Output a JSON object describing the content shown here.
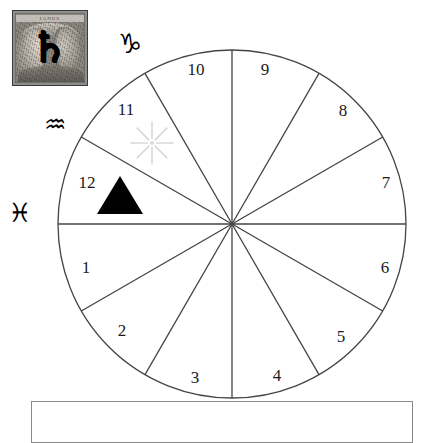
{
  "figure": {
    "background_color": "#ffffff"
  },
  "plate": {
    "caption": "IANUS",
    "overlay_glyph": "♄",
    "overlay_glyph_name": "saturn-symbol",
    "subject": "Janus two-faced bust engraving",
    "border_color": "#3a3a3a"
  },
  "zodiac_glyphs": [
    {
      "name": "capricorn",
      "glyph": "♑",
      "label": "Capricorn"
    },
    {
      "name": "aquarius",
      "glyph": "♒",
      "label": "Aquarius"
    },
    {
      "name": "pisces",
      "glyph": "♓",
      "label": "Pisces"
    }
  ],
  "wheel": {
    "center_x": 232,
    "center_y": 224,
    "radius": 174,
    "sector_count": 12,
    "stroke_color": "#444444",
    "stroke_width": 1.3,
    "houses": [
      {
        "number": "1",
        "label_x": 86,
        "label_y": 269
      },
      {
        "number": "2",
        "label_x": 122,
        "label_y": 332
      },
      {
        "number": "3",
        "label_x": 195,
        "label_y": 379
      },
      {
        "number": "4",
        "label_x": 277,
        "label_y": 377
      },
      {
        "number": "5",
        "label_x": 341,
        "label_y": 338
      },
      {
        "number": "6",
        "label_x": 385,
        "label_y": 269
      },
      {
        "number": "7",
        "label_x": 386,
        "label_y": 184
      },
      {
        "number": "8",
        "label_x": 343,
        "label_y": 112
      },
      {
        "number": "9",
        "label_x": 265,
        "label_y": 71
      },
      {
        "number": "10",
        "label_x": 196,
        "label_y": 71
      },
      {
        "number": "11",
        "label_x": 126,
        "label_y": 111
      },
      {
        "number": "12",
        "label_x": 87,
        "label_y": 184
      }
    ]
  },
  "markers": [
    {
      "name": "sun-starburst",
      "symbol": "starburst",
      "house": "11",
      "color": "#d9d9d9",
      "points": 8
    },
    {
      "name": "black-triangle",
      "symbol": "triangle",
      "house": "12",
      "color": "#000000"
    }
  ],
  "answer_box": {
    "value": "",
    "placeholder": "",
    "border_color": "#8a8a8a"
  }
}
